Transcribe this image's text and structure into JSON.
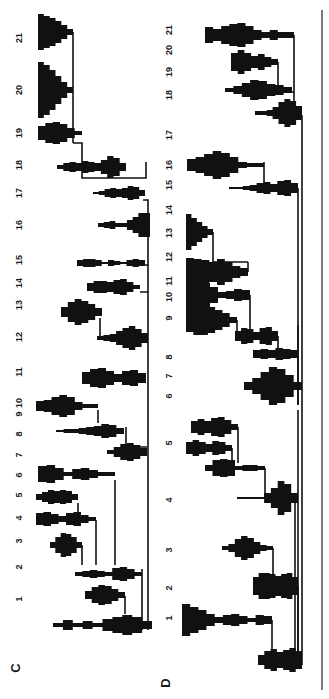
{
  "figure": {
    "rotation": "90deg counterclockwise",
    "ink_color": "#111111",
    "background": "#ffffff",
    "panels": [
      {
        "letter": "C",
        "letter_pos": [
          20,
          668
        ],
        "label_x": 20,
        "baseline_x": 148,
        "labels": [
          {
            "n": "1",
            "y": 599
          },
          {
            "n": "2",
            "y": 567
          },
          {
            "n": "3",
            "y": 541
          },
          {
            "n": "4",
            "y": 518
          },
          {
            "n": "5",
            "y": 495
          },
          {
            "n": "6",
            "y": 475
          },
          {
            "n": "7",
            "y": 455
          },
          {
            "n": "8",
            "y": 434
          },
          {
            "n": "9",
            "y": 414
          },
          {
            "n": "10",
            "y": 403
          },
          {
            "n": "11",
            "y": 372
          },
          {
            "n": "12",
            "y": 337
          },
          {
            "n": "13",
            "y": 305
          },
          {
            "n": "14",
            "y": 283
          },
          {
            "n": "15",
            "y": 260
          },
          {
            "n": "16",
            "y": 225
          },
          {
            "n": "17",
            "y": 193
          },
          {
            "n": "18",
            "y": 165
          },
          {
            "n": "19",
            "y": 133
          },
          {
            "n": "20",
            "y": 90
          },
          {
            "n": "21",
            "y": 38
          }
        ],
        "glyphs": [
          {
            "id": "C1",
            "y": 625,
            "x0": 53,
            "x1": 152,
            "w": [
              2,
              5,
              2,
              4,
              2,
              6,
              8,
              10,
              8,
              4
            ]
          },
          {
            "id": "C2",
            "y": 595,
            "x0": 85,
            "x1": 125,
            "w": [
              4,
              8,
              10,
              9,
              6,
              3
            ]
          },
          {
            "id": "C3",
            "y": 574,
            "x0": 75,
            "x1": 142,
            "w": [
              2,
              3,
              4,
              3,
              2,
              6,
              7,
              5,
              2
            ]
          },
          {
            "id": "C4",
            "y": 545,
            "x0": 50,
            "x1": 82,
            "w": [
              3,
              8,
              12,
              11,
              8,
              3
            ]
          },
          {
            "id": "C5",
            "y": 519,
            "x0": 36,
            "x1": 96,
            "w": [
              6,
              7,
              5,
              3,
              6,
              7,
              4,
              2
            ]
          },
          {
            "id": "C6",
            "y": 497,
            "x0": 36,
            "x1": 78,
            "w": [
              3,
              5,
              7,
              6,
              7,
              6,
              3
            ]
          },
          {
            "id": "C7",
            "y": 474,
            "x0": 38,
            "x1": 115,
            "w": [
              8,
              9,
              6,
              2,
              5,
              6,
              4,
              2,
              2
            ]
          },
          {
            "id": "C8",
            "y": 452,
            "x0": 107,
            "x1": 147,
            "w": [
              2,
              5,
              8,
              9,
              7,
              4
            ]
          },
          {
            "id": "C9",
            "y": 431,
            "x0": 56,
            "x1": 124,
            "w": [
              1,
              2,
              2,
              3,
              4,
              5,
              7,
              6,
              3
            ]
          },
          {
            "id": "C10",
            "y": 406,
            "x0": 36,
            "x1": 98,
            "w": [
              5,
              6,
              9,
              11,
              9,
              4,
              2,
              2
            ]
          },
          {
            "id": "C11",
            "y": 378,
            "x0": 82,
            "x1": 146,
            "w": [
              6,
              9,
              10,
              7,
              4,
              7,
              8,
              5
            ]
          },
          {
            "id": "C12",
            "y": 338,
            "x0": 97,
            "x1": 148,
            "w": [
              2,
              3,
              4,
              7,
              10,
              12,
              9,
              5
            ]
          },
          {
            "id": "C13",
            "y": 312,
            "x0": 61,
            "x1": 102,
            "w": [
              5,
              10,
              13,
              11,
              8,
              4
            ]
          },
          {
            "id": "C14",
            "y": 287,
            "x0": 87,
            "x1": 140,
            "w": [
              4,
              6,
              6,
              5,
              7,
              8,
              5,
              2
            ]
          },
          {
            "id": "C15",
            "y": 263,
            "x0": 77,
            "x1": 145,
            "w": [
              3,
              4,
              4,
              3,
              1,
              3,
              2,
              1,
              3,
              4,
              3
            ]
          },
          {
            "id": "C16",
            "y": 225,
            "x0": 98,
            "x1": 150,
            "w": [
              2,
              3,
              4,
              2,
              2,
              5,
              8,
              12,
              12
            ]
          },
          {
            "id": "C17",
            "y": 193,
            "x0": 93,
            "x1": 145,
            "w": [
              1,
              2,
              4,
              5,
              4,
              5,
              7,
              6,
              3
            ]
          },
          {
            "id": "C18",
            "y": 167,
            "x0": 57,
            "x1": 126,
            "w": [
              2,
              4,
              5,
              4,
              6,
              5,
              4,
              7,
              11,
              9,
              4
            ]
          },
          {
            "id": "C19",
            "y": 133,
            "x0": 38,
            "x1": 82,
            "w": [
              7,
              10,
              11,
              9,
              5,
              2
            ]
          },
          {
            "id": "C20",
            "y": 90,
            "x0": 38,
            "x1": 73,
            "w": [
              28,
              25,
              20,
              14,
              8,
              3
            ]
          },
          {
            "id": "C21",
            "y": 32,
            "x0": 38,
            "x1": 73,
            "w": [
              18,
              16,
              14,
              11,
              7,
              3
            ]
          }
        ],
        "connectors": [
          "M146,162 L146,178 L124,178",
          "M124,178 L82,178 L82,143 L73,143",
          "M73,143 L73,32",
          "M73,90 L68,90",
          "M148,226 L148,200 L143,200",
          "M148,226 L148,265 L145,265",
          "M148,265 L148,292 L140,292",
          "M148,292 L148,338",
          "M100,338 L100,318",
          "M148,338 L148,382",
          "M148,382 L148,447",
          "M126,427 L126,447 L147,447",
          "M98,410 L98,423",
          "M148,447 L148,630",
          "M115,480 L115,565",
          "M96,520 L96,565",
          "M78,503 L78,514",
          "M82,545 L82,565",
          "M142,569 L142,630",
          "M125,596 L125,614"
        ]
      },
      {
        "letter": "D",
        "letter_pos": [
          170,
          683
        ],
        "label_x": 170,
        "baseline_x": 302,
        "labels": [
          {
            "n": "1",
            "y": 618
          },
          {
            "n": "2",
            "y": 588
          },
          {
            "n": "3",
            "y": 550
          },
          {
            "n": "4",
            "y": 500
          },
          {
            "n": "5",
            "y": 443
          },
          {
            "n": "6",
            "y": 396
          },
          {
            "n": "7",
            "y": 376
          },
          {
            "n": "8",
            "y": 357
          },
          {
            "n": "9",
            "y": 318
          },
          {
            "n": "10",
            "y": 297
          },
          {
            "n": "11",
            "y": 281
          },
          {
            "n": "12",
            "y": 257
          },
          {
            "n": "13",
            "y": 233
          },
          {
            "n": "14",
            "y": 210
          },
          {
            "n": "15",
            "y": 185
          },
          {
            "n": "16",
            "y": 165
          },
          {
            "n": "17",
            "y": 135
          },
          {
            "n": "18",
            "y": 95
          },
          {
            "n": "19",
            "y": 72
          },
          {
            "n": "20",
            "y": 50
          },
          {
            "n": "21",
            "y": 30
          }
        ],
        "glyphs": [
          {
            "id": "D1",
            "y": 660,
            "x0": 258,
            "x1": 302,
            "w": [
              5,
              9,
              11,
              8,
              10,
              12,
              9
            ]
          },
          {
            "id": "D2",
            "y": 620,
            "x0": 182,
            "x1": 272,
            "w": [
              16,
              13,
              10,
              6,
              3,
              5,
              6,
              4,
              2,
              5,
              4
            ]
          },
          {
            "id": "D3",
            "y": 586,
            "x0": 253,
            "x1": 298,
            "w": [
              9,
              13,
              13,
              12,
              10,
              12,
              13,
              9
            ]
          },
          {
            "id": "D4",
            "y": 548,
            "x0": 222,
            "x1": 273,
            "w": [
              2,
              4,
              9,
              12,
              10,
              6,
              3,
              2
            ]
          },
          {
            "id": "D5",
            "y": 498,
            "x0": 237,
            "x1": 298,
            "w": [
              1,
              1,
              1,
              1,
              5,
              10,
              17,
              14,
              5
            ]
          },
          {
            "id": "D6",
            "y": 468,
            "x0": 205,
            "x1": 265,
            "w": [
              3,
              8,
              9,
              8,
              2,
              3,
              3,
              2
            ]
          },
          {
            "id": "D7",
            "y": 448,
            "x0": 186,
            "x1": 232,
            "w": [
              6,
              8,
              6,
              4,
              7,
              6,
              3
            ]
          },
          {
            "id": "D8",
            "y": 427,
            "x0": 191,
            "x1": 238,
            "w": [
              6,
              8,
              6,
              9,
              10,
              7,
              3
            ]
          },
          {
            "id": "D9",
            "y": 386,
            "x0": 244,
            "x1": 302,
            "w": [
              4,
              8,
              14,
              19,
              17,
              11,
              4
            ]
          },
          {
            "id": "D10",
            "y": 354,
            "x0": 253,
            "x1": 298,
            "w": [
              4,
              5,
              4,
              6,
              5,
              4
            ]
          },
          {
            "id": "D11",
            "y": 336,
            "x0": 235,
            "x1": 278,
            "w": [
              5,
              8,
              7,
              4,
              8,
              9,
              5
            ]
          },
          {
            "id": "D12",
            "y": 320,
            "x0": 186,
            "x1": 237,
            "w": [
              12,
              15,
              15,
              13,
              10,
              7,
              3
            ]
          },
          {
            "id": "D13",
            "y": 295,
            "x0": 186,
            "x1": 250,
            "w": [
              14,
              15,
              12,
              8,
              3,
              4,
              6,
              5
            ]
          },
          {
            "id": "D14",
            "y": 272,
            "x0": 186,
            "x1": 248,
            "w": [
              14,
              13,
              12,
              10,
              13,
              10,
              6,
              4
            ]
          },
          {
            "id": "D15",
            "y": 232,
            "x0": 186,
            "x1": 213,
            "w": [
              18,
              14,
              10,
              6,
              3
            ]
          },
          {
            "id": "D16",
            "y": 188,
            "x0": 229,
            "x1": 298,
            "w": [
              1,
              1,
              2,
              3,
              5,
              6,
              4,
              7,
              8,
              5
            ]
          },
          {
            "id": "D17",
            "y": 165,
            "x0": 187,
            "x1": 264,
            "w": [
              6,
              8,
              11,
              14,
              12,
              8,
              3,
              2,
              2
            ]
          },
          {
            "id": "D18",
            "y": 113,
            "x0": 255,
            "x1": 302,
            "w": [
              2,
              2,
              3,
              6,
              11,
              14,
              12,
              7
            ]
          },
          {
            "id": "D19",
            "y": 90,
            "x0": 225,
            "x1": 292,
            "w": [
              2,
              4,
              7,
              10,
              9,
              6,
              5,
              3
            ]
          },
          {
            "id": "D20",
            "y": 62,
            "x0": 231,
            "x1": 278,
            "w": [
              9,
              12,
              9,
              6,
              8,
              5,
              3
            ]
          },
          {
            "id": "D21",
            "y": 35,
            "x0": 205,
            "x1": 294,
            "w": [
              8,
              6,
              9,
              11,
              12,
              9,
              5,
              3,
              5,
              3,
              3
            ]
          }
        ],
        "connectors": [
          "M302,405 L302,665",
          "M298,410 L298,660",
          "M294,35 L294,92 L292,92",
          "M294,92 L294,116 L302,116 L302,405",
          "M278,62 L278,92",
          "M298,188 L298,405",
          "M264,162 L264,188",
          "M298,325 L298,405",
          "M278,336 L278,352",
          "M237,320 L237,335",
          "M250,295 L250,335",
          "M248,272 L248,262",
          "M213,232 L213,262 L248,262",
          "M295,498 L295,665",
          "M265,468 L265,498",
          "M232,448 L232,463",
          "M238,427 L238,463",
          "M273,548 L273,586",
          "M298,586 L298,660",
          "M272,620 L272,650"
        ]
      }
    ],
    "outer_axis": {
      "x": 322,
      "y0": 10,
      "y1": 690
    }
  }
}
